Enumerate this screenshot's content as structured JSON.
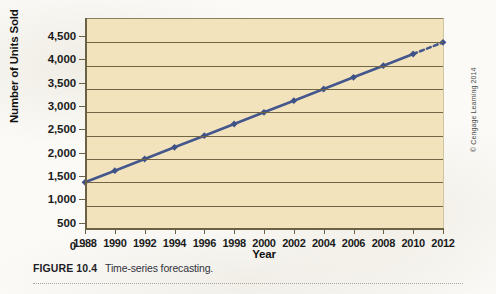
{
  "figure": {
    "label": "FIGURE 10.4",
    "caption": "Time-series forecasting.",
    "copyright": "© Cengage Learning 2014"
  },
  "colors": {
    "plot_background": "#f3e3bd",
    "gridline": "#6f6544",
    "series_line": "#44578c",
    "marker": "#3f5288",
    "page_background": "#fbfaf7"
  },
  "chart_data": {
    "type": "line",
    "title": "",
    "xlabel": "Year",
    "ylabel": "Number of Units Sold",
    "x": [
      1988,
      1990,
      1992,
      1994,
      1996,
      1998,
      2000,
      2002,
      2004,
      2006,
      2008,
      2010,
      2012
    ],
    "xtick_labels": [
      "1988",
      "1990",
      "1992",
      "1994",
      "1996",
      "1998",
      "2000",
      "2002",
      "2004",
      "2006",
      "2008",
      "2010",
      "2012"
    ],
    "values": [
      1000,
      1250,
      1500,
      1750,
      2000,
      2250,
      2500,
      2750,
      3000,
      3250,
      3500,
      3750,
      4000
    ],
    "ylim": [
      0,
      4500
    ],
    "ytick_values": [
      0,
      500,
      1000,
      1500,
      2000,
      2500,
      3000,
      3500,
      4000,
      4500
    ],
    "ytick_labels": [
      "0",
      "500",
      "1,000",
      "1,500",
      "2,000",
      "2,500",
      "3,000",
      "3,500",
      "4,000",
      "4,500"
    ],
    "xlim": [
      1988,
      2012
    ],
    "grid": true,
    "legend": false,
    "series": [
      {
        "name": "Units sold",
        "values": [
          1000,
          1250,
          1500,
          1750,
          2000,
          2250,
          2500,
          2750,
          3000,
          3250,
          3500,
          3750,
          4000
        ],
        "actual_through_x": 2010,
        "forecast_from_x": 2010,
        "forecast_style": "dashed",
        "marker": "diamond"
      }
    ],
    "annotations": []
  }
}
